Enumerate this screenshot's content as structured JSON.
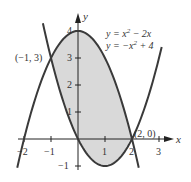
{
  "chart_data": {
    "type": "line",
    "title": "",
    "xlabel": "x",
    "ylabel": "y",
    "xlim": [
      -2.3,
      3.5
    ],
    "ylim": [
      -1.3,
      4.6
    ],
    "grid": false,
    "legend_position": "top-right",
    "x_ticks": [
      -2,
      -1,
      1,
      2,
      3
    ],
    "x_tick_labels": [
      "−2",
      "−1",
      "1",
      "2",
      "3"
    ],
    "y_ticks": [
      -1,
      1,
      2,
      3,
      4
    ],
    "y_tick_labels": [
      "−1",
      "1",
      "2",
      "3",
      "4"
    ],
    "series": [
      {
        "name": "y = x² − 2x",
        "expression": "x^2 - 2x",
        "x_range": [
          -1.3,
          3.1
        ],
        "x": [
          -1,
          0,
          1,
          2,
          3
        ],
        "values": [
          3,
          0,
          -1,
          0,
          3
        ]
      },
      {
        "name": "y = −x² + 4",
        "expression": "-x^2 + 4",
        "x_range": [
          -2.25,
          2.25
        ],
        "x": [
          -2,
          -1,
          0,
          1,
          2
        ],
        "values": [
          0,
          3,
          4,
          3,
          0
        ]
      }
    ],
    "shaded_region": {
      "between": [
        "y = −x² + 4",
        "y = x² − 2x"
      ],
      "x_from": -1,
      "x_to": 2,
      "color": "#d9d9d9"
    },
    "annotations": [
      {
        "text": "(−1, 3)",
        "x": -1,
        "y": 3
      },
      {
        "text": "(2, 0)",
        "x": 2,
        "y": 0
      }
    ]
  },
  "labels": {
    "x_axis": "x",
    "y_axis": "y",
    "legend_1_lhs": "y = x",
    "legend_1_sup": "2",
    "legend_1_rhs": " − 2x",
    "legend_2_lhs": "y = −x",
    "legend_2_sup": "2",
    "legend_2_rhs": " + 4",
    "point_left": "(−1, 3)",
    "point_right": "(2, 0)",
    "tick_xm2": "−2",
    "tick_xm1": "−1",
    "tick_x1": "1",
    "tick_x2": "2",
    "tick_x3": "3",
    "tick_y4": "4",
    "tick_y3": "3",
    "tick_y2": "2",
    "tick_y1": "1",
    "tick_ym1": "−1"
  },
  "colors": {
    "curve": "#3a3a3a",
    "fill": "#d9d9d9",
    "axis": "#222222"
  }
}
